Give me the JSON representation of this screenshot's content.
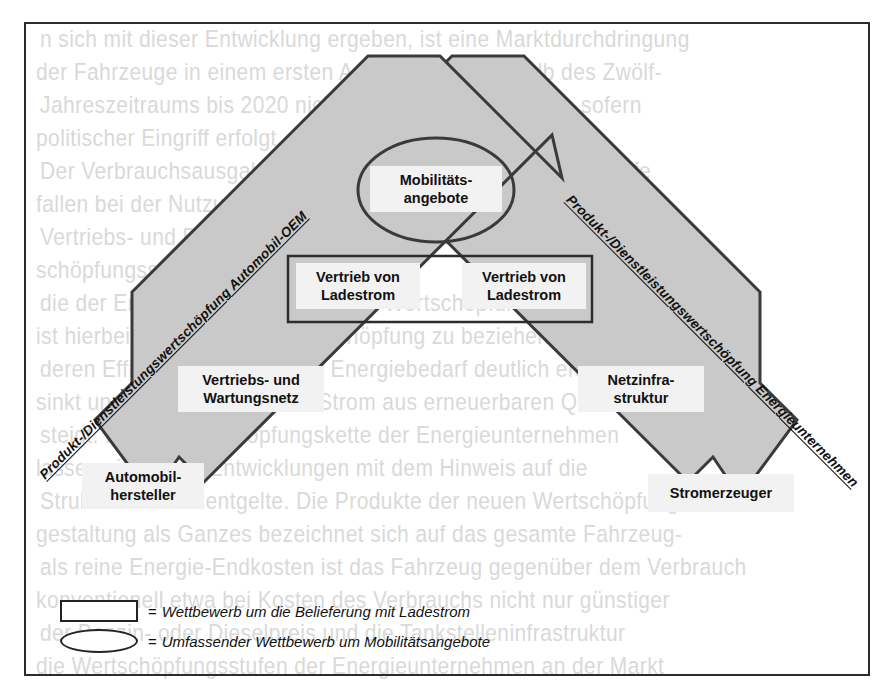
{
  "diagram": {
    "title_visible": false,
    "colors": {
      "arrow_fill": "#c9c9c9",
      "arrow_stroke": "#3a3a3a",
      "label_bg": "#f2f2f2",
      "frame": "#2c2c2c",
      "text": "#111111"
    },
    "axis_labels": {
      "left": "Produkt-/Dienstleistungswertschöpfung Automobil-OEM",
      "right": "Produkt-/Dienstleistungswertschöpfung Energieunternehmen"
    },
    "nodes": {
      "center_ellipse": "Mobilitäts-\nangebote",
      "center_ellipse_line1": "Mobilitäts-",
      "center_ellipse_line2": "angebote",
      "box_left_line1": "Vertrieb von",
      "box_left_line2": "Ladestrom",
      "box_right_line1": "Vertrieb von",
      "box_right_line2": "Ladestrom",
      "left_mid_line1": "Vertriebs- und",
      "left_mid_line2": "Wartungsnetz",
      "right_mid_line1": "Netzinfra-",
      "right_mid_line2": "struktur",
      "left_bottom_line1": "Automobil-",
      "left_bottom_line2": "hersteller",
      "right_bottom": "Stromerzeuger"
    }
  },
  "legend": {
    "rows": [
      {
        "symbol": "rectangle",
        "equals": "=",
        "text": "Wettbewerb um die Belieferung mit Ladestrom"
      },
      {
        "symbol": "ellipse",
        "equals": "=",
        "text": "Umfassender Wettbewerb um Mobilitätsangebote"
      }
    ]
  },
  "background_bleed": {
    "lines": [
      "n sich mit dieser Entwicklung ergeben, ist eine Marktdurchdringung",
      "der Fahrzeuge in einem ersten Ansatz auch innerhalb des Zwölf-",
      "Jahreszeitraums bis 2020 nicht unmittelbar abzusehen, sofern",
      "politischer Eingriff erfolgt.",
      "Der Verbrauchsausgaben der privaten Haushalte für Kraftstoffe",
      "fallen bei der Nutzung von Elektrofahrzeugen weitgehend weg.",
      "Vertriebs- und Dienstleistungswertschöpfung entlang der Wert-",
      "schöpfungsstufen sowie die",
      "die der Energieversorger sowie die Wertschöpfung von Kunden",
      "ist hierbei auf die Energiewertschöpfung zu beziehen, da durch",
      "deren Effizienzsteigerung der Energiebedarf deutlich ersichtlich",
      "sinkt und die Bedeutung von Strom aus erneuerbaren Quellen",
      "steigt. In der Wertschöpfungskette der Energieunternehmen",
      "lassen sich diese Entwicklungen mit dem Hinweis auf die",
      "Struktur der Netzentgelte. Die Produkte der neuen Wertschöpfungs-",
      "gestaltung als Ganzes bezeichnet sich auf das gesamte Fahrzeug-",
      "als reine Energie-Endkosten ist das Fahrzeug gegenüber dem Verbrauch",
      "konventionell etwa bei Kosten des Verbrauchs nicht nur günstiger",
      "der Benzin- oder Dieselpreis und die Tankstelleninfrastruktur",
      "die Wertschöpfungsstufen der Energieunternehmen an der Markt"
    ]
  }
}
